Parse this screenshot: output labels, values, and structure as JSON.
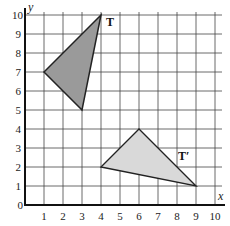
{
  "diagram": {
    "type": "coordinate-grid-transformation",
    "x_axis": {
      "label": "x",
      "ticks": [
        "0",
        "1",
        "2",
        "3",
        "4",
        "5",
        "6",
        "7",
        "8",
        "9",
        "10"
      ],
      "range": [
        0,
        10
      ]
    },
    "y_axis": {
      "label": "y",
      "ticks": [
        "1",
        "2",
        "3",
        "4",
        "5",
        "6",
        "7",
        "8",
        "9",
        "10"
      ],
      "range": [
        0,
        10
      ]
    },
    "shapes": [
      {
        "name": "T",
        "label": "T",
        "vertices": [
          [
            1,
            7
          ],
          [
            4,
            10
          ],
          [
            3,
            5
          ]
        ],
        "fill": "#9a9a9a"
      },
      {
        "name": "T-prime",
        "label": "T′",
        "vertices": [
          [
            4,
            2
          ],
          [
            6,
            4
          ],
          [
            9,
            1
          ]
        ],
        "fill": "#d6d6d6"
      }
    ]
  }
}
